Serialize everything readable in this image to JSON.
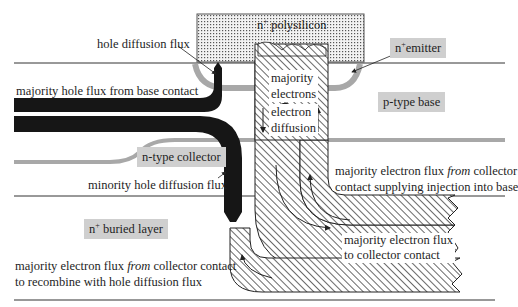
{
  "regions": {
    "polysilicon": {
      "prefix": "n",
      "sup": "+",
      "suffix": " polysilicon"
    },
    "emitter": {
      "prefix": "n",
      "sup": "+",
      "suffix": "emitter"
    },
    "base": "p-type base",
    "collector": "n-type collector",
    "buried_layer": {
      "prefix": "n",
      "sup": "+",
      "suffix": " buried layer"
    }
  },
  "labels": {
    "hole_diffusion_flux": "hole diffusion flux",
    "majority_hole_flux": "majority hole flux from base contact",
    "majority_electrons_1": "majority",
    "majority_electrons_2": "electrons",
    "electron_diffusion_1": "electron",
    "electron_diffusion_2": "diffusion",
    "minority_hole_diffusion": "minority hole diffusion flux",
    "supply_line1_pre": "majority electron flux ",
    "supply_line1_em": "from",
    "supply_line1_post": " collector",
    "supply_line2": "contact supplying injection into base",
    "to_collector_1": "majority electron flux",
    "to_collector_2": "to collector contact",
    "recombine_line1_pre": "majority electron flux ",
    "recombine_line1_em": "from",
    "recombine_line1_post": " collector contact",
    "recombine_line2": "to recombine with hole diffusion flux"
  },
  "colors": {
    "region_box": "#cfcfcf",
    "hole_flux": "#161616",
    "junction_band": "#a8a8a8",
    "line": "#333333",
    "hatch": "#2a2a2a"
  }
}
